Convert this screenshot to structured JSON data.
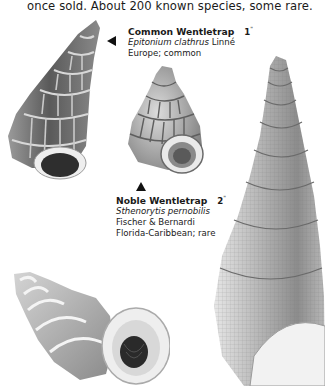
{
  "page": {
    "intro_text": "once sold. About 200 known species, some rare."
  },
  "captions": [
    {
      "common_name": "Common Wentletrap",
      "size_number": "1",
      "size_unit": "\"",
      "scientific_name": "Epitonium clathrus",
      "author": "Linné",
      "range_status": "Europe; common",
      "pointer": "left-arrow"
    },
    {
      "common_name": "Noble Wentletrap",
      "size_number": "2",
      "size_unit": "\"",
      "scientific_name": "Sthenorytis pernobilis",
      "author": "Fischer & Bernardi",
      "range_status": "Florida-Caribbean; rare",
      "pointer": "up-arrow"
    }
  ],
  "illustrations": [
    {
      "id": "common-wentletrap-shell",
      "tone": "#6e6e6e"
    },
    {
      "id": "noble-wentletrap-shell",
      "tone": "#9a9a9a"
    },
    {
      "id": "large-wentletrap-shell",
      "tone": "#b0b0b0"
    },
    {
      "id": "bottom-wentletrap-shell",
      "tone": "#a8a8a8"
    }
  ]
}
